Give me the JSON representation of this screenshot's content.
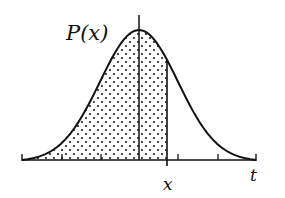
{
  "figure": {
    "function_label": "P(x)",
    "x_label": "x",
    "axis_label": "t",
    "colors": {
      "stroke": "#111111",
      "dots": "#222222",
      "background": "#ffffff"
    }
  },
  "chart_data": {
    "type": "area",
    "title": "",
    "curve": "gaussian",
    "xlabel": "t",
    "ylabel": "",
    "annotations": [
      "P(x)",
      "x",
      "t"
    ],
    "x_range": [
      -3,
      3
    ],
    "mean": 0,
    "std": 1,
    "shaded_region": {
      "from": -3,
      "to": 0.7
    },
    "marked_x": 0.7,
    "tick_positions": [
      -3,
      -2,
      -1,
      0,
      1,
      2,
      3
    ],
    "grid": false,
    "legend": "none"
  }
}
